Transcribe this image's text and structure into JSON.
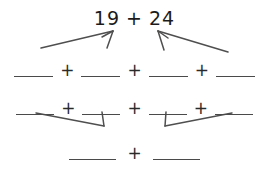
{
  "document": {
    "type": "math-worksheet",
    "title": "Addition decomposition diagram",
    "ink_color": "#3c3c3c",
    "background_color": "#ffffff"
  },
  "top_expression": {
    "left_addend": "19",
    "operator": "+",
    "right_addend": "24",
    "full_text": "19 + 24"
  },
  "rows": {
    "row_a": {
      "description": "four blanks separated by plus signs",
      "blanks": [
        "",
        "",
        "",
        ""
      ],
      "operators": [
        "+",
        "+",
        "+"
      ]
    },
    "row_b": {
      "description": "four blanks separated by plus signs",
      "blanks": [
        "",
        "",
        "",
        ""
      ],
      "operators": [
        "+",
        "+",
        "+"
      ]
    },
    "row_c": {
      "description": "two blanks separated by a plus sign",
      "blanks": [
        "",
        ""
      ],
      "operators": [
        "+"
      ]
    }
  },
  "arrows": {
    "from_19": [
      {
        "name": "arrow-19-to-blank-1",
        "direction": "down-left"
      },
      {
        "name": "arrow-19-to-blank-2",
        "direction": "down"
      }
    ],
    "from_24": [
      {
        "name": "arrow-24-to-blank-3",
        "direction": "down"
      },
      {
        "name": "arrow-24-to-blank-4",
        "direction": "down-right"
      }
    ],
    "row_a_to_row_b": [
      {
        "name": "arrow-merge-left",
        "direction": "converge-down"
      },
      {
        "name": "arrow-merge-right",
        "direction": "converge-down"
      }
    ]
  }
}
